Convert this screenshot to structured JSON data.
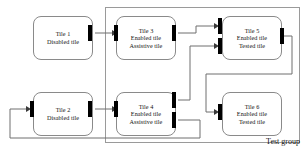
{
  "diagram": {
    "group": {
      "label": "Test group",
      "x": 105,
      "y": 7,
      "width": 195,
      "height": 136
    },
    "colors": {
      "tile_border": "#8a8a8a",
      "tile_fill": "#ffffff",
      "port": "#000000",
      "connector": "#6f6f6f",
      "group_border": "#9a9a9a",
      "text": "#111111"
    },
    "tiles": [
      {
        "id": "tile-1",
        "name": "Tile 1",
        "state": "Disabled tile",
        "role": "",
        "x": 33,
        "y": 16,
        "width": 60,
        "height": 44,
        "lines": [
          "Tile 1",
          "Disabled tile"
        ]
      },
      {
        "id": "tile-2",
        "name": "Tile 2",
        "state": "Disabled tile",
        "role": "",
        "x": 33,
        "y": 92,
        "width": 60,
        "height": 44,
        "lines": [
          "Tile 2",
          "Disabled tile"
        ]
      },
      {
        "id": "tile-3",
        "name": "Tile 3",
        "state": "Enabled tile",
        "role": "Assistive tile",
        "x": 116,
        "y": 16,
        "width": 60,
        "height": 44,
        "lines": [
          "Tile 3",
          "Enabled tile",
          "Assistive tile"
        ]
      },
      {
        "id": "tile-4",
        "name": "Tile 4",
        "state": "Enabled tile",
        "role": "Assistive tile",
        "x": 116,
        "y": 92,
        "width": 60,
        "height": 44,
        "lines": [
          "Tile 4",
          "Enabled tile",
          "Assistive tile"
        ]
      },
      {
        "id": "tile-5",
        "name": "Tile 5",
        "state": "Enabled tile",
        "role": "Tested tile",
        "x": 222,
        "y": 16,
        "width": 60,
        "height": 44,
        "lines": [
          "Tile 5",
          "Enabled tile",
          "Tested tile"
        ]
      },
      {
        "id": "tile-6",
        "name": "Tile 6",
        "state": "Enabled tile",
        "role": "Tested tile",
        "x": 222,
        "y": 92,
        "width": 60,
        "height": 44,
        "lines": [
          "Tile 6",
          "Enabled tile",
          "Tested tile"
        ]
      }
    ],
    "ports": [
      {
        "id": "tile-1-out",
        "tile": "Tile 1",
        "kind": "output",
        "x": 91,
        "y": 31
      },
      {
        "id": "tile-3-in",
        "tile": "Tile 3",
        "kind": "input",
        "x": 114,
        "y": 31
      },
      {
        "id": "tile-3-out",
        "tile": "Tile 3",
        "kind": "output",
        "x": 174,
        "y": 31
      },
      {
        "id": "tile-5-in-a",
        "tile": "Tile 5",
        "kind": "input",
        "x": 220,
        "y": 24
      },
      {
        "id": "tile-5-in-b",
        "tile": "Tile 5",
        "kind": "input",
        "x": 220,
        "y": 44
      },
      {
        "id": "tile-5-out",
        "tile": "Tile 5",
        "kind": "output",
        "x": 280,
        "y": 34
      },
      {
        "id": "tile-2-in",
        "tile": "Tile 2",
        "kind": "input",
        "x": 31,
        "y": 107
      },
      {
        "id": "tile-2-out",
        "tile": "Tile 2",
        "kind": "output",
        "x": 91,
        "y": 107
      },
      {
        "id": "tile-4-in",
        "tile": "Tile 4",
        "kind": "input",
        "x": 114,
        "y": 107
      },
      {
        "id": "tile-4-out-a",
        "tile": "Tile 4",
        "kind": "output",
        "x": 174,
        "y": 98
      },
      {
        "id": "tile-4-out-b",
        "tile": "Tile 4",
        "kind": "output",
        "x": 174,
        "y": 118
      },
      {
        "id": "tile-6-in",
        "tile": "Tile 6",
        "kind": "input",
        "x": 220,
        "y": 110
      }
    ],
    "connectors": [
      {
        "id": "c1",
        "from": "Tile 1",
        "to": "Tile 3",
        "path": "M95,33 L112,33"
      },
      {
        "id": "c2",
        "from": "Tile 3",
        "to": "Tile 5",
        "path": "M178,33 L196,33 L196,26 L217,26"
      },
      {
        "id": "c3",
        "from": "Tile 4",
        "to": "Tile 5",
        "path": "M178,100 L190,100 L190,46 L217,46"
      },
      {
        "id": "c4",
        "from": "Tile 2",
        "to": "Tile 4",
        "path": "M95,109 L112,109"
      },
      {
        "id": "c5",
        "from": "Tile 5",
        "to": "Tile 6",
        "path": "M284,36 L292,36 L292,74 L206,74 L206,112 L217,112"
      },
      {
        "id": "c6",
        "from": "Tile 4",
        "to": "Tile 2",
        "path": "M178,120 L200,120 L200,138 L10,138 L10,109 L28,109"
      }
    ]
  }
}
